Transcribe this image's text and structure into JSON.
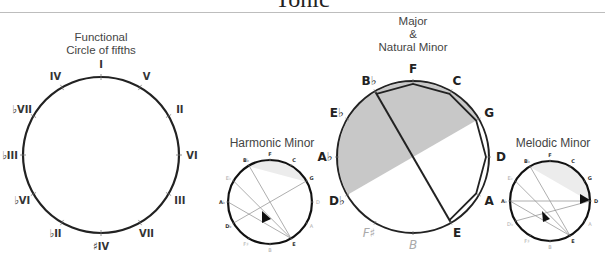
{
  "header": {
    "title": "Tonic"
  },
  "captions": {
    "functional": [
      "Functional",
      "Circle of fifths"
    ],
    "major": [
      "Major",
      "&",
      "Natural Minor"
    ],
    "harmonic": "Harmonic Minor",
    "melodic": "Melodic Minor"
  },
  "functional_circle": {
    "labels": [
      "I",
      "V",
      "II",
      "VI",
      "III",
      "VII",
      "♯IV",
      "♭II",
      "♭VI",
      "♭III",
      "♭VII",
      "IV"
    ]
  },
  "note_circle": {
    "labels": [
      "F",
      "C",
      "G",
      "D",
      "A",
      "E",
      "B",
      "F♯",
      "D♭",
      "A♭",
      "E♭",
      "B♭"
    ],
    "faint": [
      "B",
      "F♯"
    ]
  },
  "harmonic_circle": {
    "labels": [
      "F",
      "C",
      "G",
      "D",
      "A",
      "E",
      "B",
      "F♯",
      "D♭",
      "A♭",
      "E♭",
      "B♭"
    ]
  },
  "melodic_circle": {
    "labels": [
      "F",
      "C",
      "G",
      "D",
      "A",
      "E",
      "B",
      "F♯",
      "D♭",
      "A♭",
      "E♭",
      "B♭"
    ]
  },
  "colors": {
    "shade": "#c8c8c8",
    "light_shade": "#ececec",
    "line": "#222222",
    "faint": "#aaaaaa"
  }
}
